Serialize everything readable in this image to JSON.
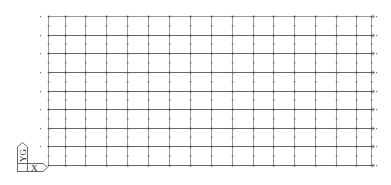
{
  "viewport": {
    "background": "#ffffff",
    "grid_color": "#555555",
    "dot_color": "#777777",
    "grid": {
      "x_lines": [
        48,
        65,
        85,
        106,
        127,
        148,
        169,
        190,
        211,
        232,
        253,
        273,
        294,
        315,
        336,
        356,
        371
      ],
      "y_lines": [
        16,
        35,
        53,
        72,
        91,
        109,
        128,
        146,
        165
      ],
      "x_start": 40,
      "x_end": 374,
      "y_start": 14,
      "y_end": 166
    }
  },
  "ucs_icon": {
    "y_label": "YG",
    "x_label": "X"
  }
}
